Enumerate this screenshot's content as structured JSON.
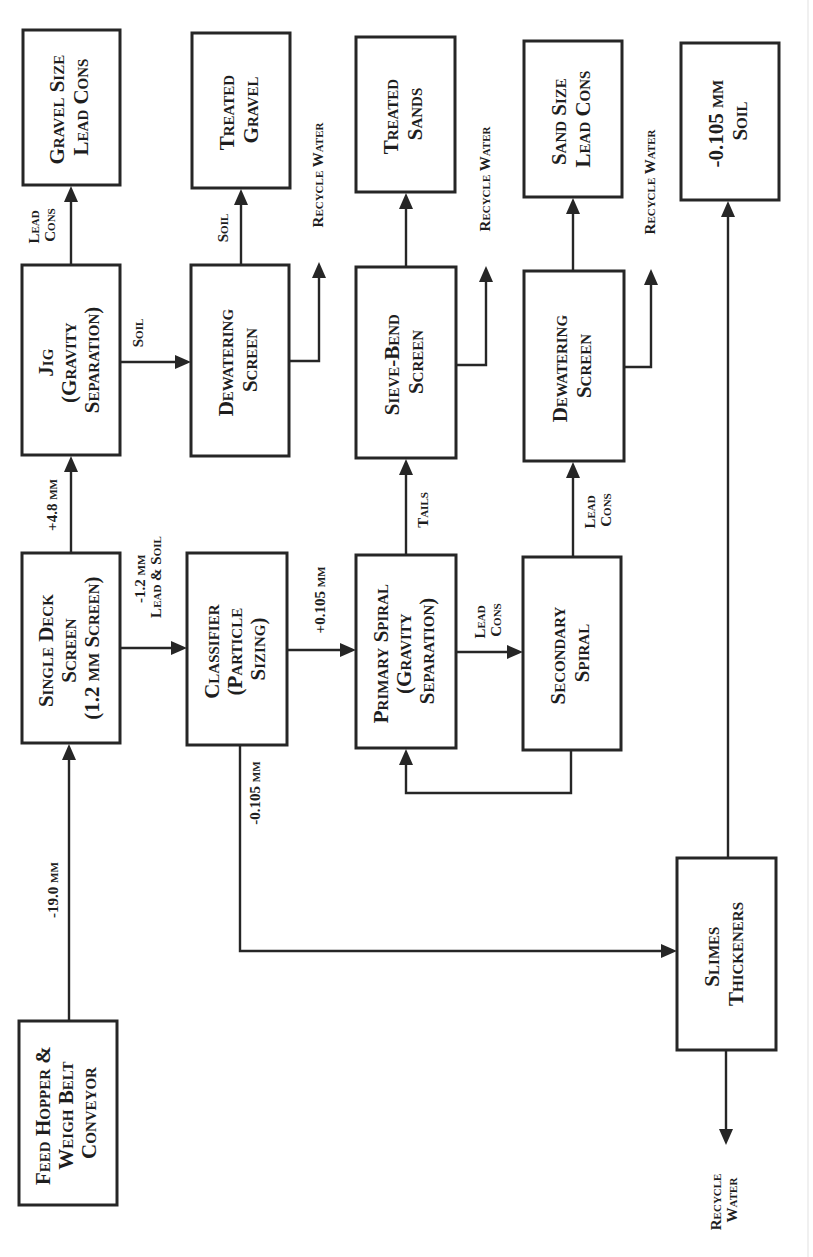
{
  "diagram": {
    "orientation": "rotated 90 degrees counter-clockwise",
    "colors": {
      "ink": "#262626",
      "background": "#ffffff"
    },
    "nodes": {
      "feed_hopper": {
        "lines": [
          "Feed Hopper &",
          "Weigh Belt",
          "Conveyor"
        ]
      },
      "single_deck_screen": {
        "lines": [
          "Single Deck",
          "Screen",
          "(1.2 mm Screen)"
        ]
      },
      "jig": {
        "lines": [
          "Jig",
          "(Gravity",
          "Separation)"
        ]
      },
      "gravel_size_lead_cons": {
        "lines": [
          "Gravel Size",
          "Lead Cons"
        ]
      },
      "dewatering_screen_1": {
        "lines": [
          "Dewatering",
          "Screen"
        ]
      },
      "treated_gravel": {
        "lines": [
          "Treated",
          "Gravel"
        ]
      },
      "classifier": {
        "lines": [
          "Classifier",
          "(Particle",
          "Sizing)"
        ]
      },
      "primary_spiral": {
        "lines": [
          "Primary Spiral",
          "(Gravity",
          "Separation)"
        ]
      },
      "sieve_bend_screen": {
        "lines": [
          "Sieve-Bend",
          "Screen"
        ]
      },
      "treated_sands": {
        "lines": [
          "Treated",
          "Sands"
        ]
      },
      "secondary_spiral": {
        "lines": [
          "Secondary",
          "Spiral"
        ]
      },
      "dewatering_screen_2": {
        "lines": [
          "Dewatering",
          "Screen"
        ]
      },
      "sand_size_lead_cons": {
        "lines": [
          "Sand Size",
          "Lead Cons"
        ]
      },
      "fine_soil": {
        "lines": [
          "-0.105 mm",
          "Soil"
        ]
      },
      "slimes_thickeners": {
        "lines": [
          "Slimes",
          "Thickeners"
        ]
      }
    },
    "flows": {
      "feed_to_screen": {
        "lines": [
          "-19.0 mm"
        ]
      },
      "screen_to_jig": {
        "lines": [
          "+4.8 mm"
        ]
      },
      "jig_to_gravel_cons": {
        "lines": [
          "Lead",
          "Cons"
        ]
      },
      "jig_to_dewatering": {
        "lines": [
          "Soil"
        ]
      },
      "dewatering_to_treated_gravel": {
        "lines": [
          "Soil"
        ]
      },
      "dewatering_1_recycle": {
        "lines": [
          "Recycle Water"
        ]
      },
      "screen_to_classifier": {
        "lines": [
          "-1.2 mm",
          "Lead & Soil"
        ]
      },
      "classifier_to_primary": {
        "lines": [
          "+0.105 mm"
        ]
      },
      "classifier_to_slimes": {
        "lines": [
          "-0.105 mm"
        ]
      },
      "primary_to_sieve": {
        "lines": [
          "Tails"
        ]
      },
      "sieve_recycle": {
        "lines": [
          "Recycle Water"
        ]
      },
      "primary_to_secondary": {
        "lines": [
          "Lead",
          "Cons"
        ]
      },
      "secondary_to_dewatering": {
        "lines": [
          "Lead",
          "Cons"
        ]
      },
      "dewatering_2_recycle": {
        "lines": [
          "Recycle Water"
        ]
      },
      "slimes_recycle": {
        "lines": [
          "Recycle",
          "Water"
        ]
      }
    }
  }
}
